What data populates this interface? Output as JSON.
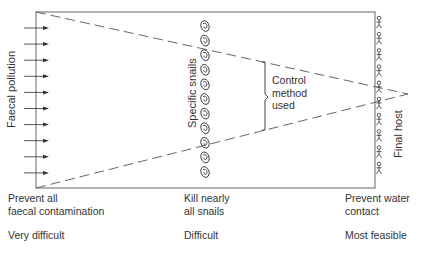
{
  "diagram": {
    "left_label": "Faecal pollution",
    "middle_label": "Specific snails",
    "right_label": "Final host",
    "control_label": [
      "Control",
      "method",
      "used"
    ],
    "columns": [
      {
        "action": [
          "Prevent all",
          "faecal contamination"
        ],
        "difficulty": "Very difficult"
      },
      {
        "action": [
          "Kill nearly",
          "all snails"
        ],
        "difficulty": "Difficult"
      },
      {
        "action": [
          "Prevent water",
          "contact"
        ],
        "difficulty": "Most feasible"
      }
    ],
    "counts": {
      "arrows": 10,
      "snails": 11,
      "humans": 10
    },
    "icons": {
      "arrow": "arrow-right-icon",
      "snail": "snail-icon",
      "human": "human-figure-icon"
    },
    "colors": {
      "line": "#555555",
      "text": "#333333",
      "background": "#ffffff"
    }
  }
}
